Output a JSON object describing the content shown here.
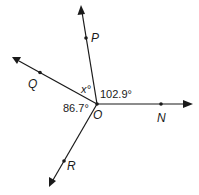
{
  "diagram": {
    "vertex": {
      "label": "O"
    },
    "rays": [
      {
        "name": "OP",
        "point_label": "P",
        "direction": "up-slightly-left"
      },
      {
        "name": "OQ",
        "point_label": "Q",
        "direction": "up-left"
      },
      {
        "name": "ON",
        "point_label": "N",
        "direction": "right"
      },
      {
        "name": "OR",
        "point_label": "R",
        "direction": "down-left"
      }
    ],
    "angles": {
      "QOP": "x°",
      "PON": "102.9°",
      "QOR": "86.7°"
    },
    "colors": {
      "line": "#1a1a1a",
      "background": "#ffffff"
    }
  }
}
